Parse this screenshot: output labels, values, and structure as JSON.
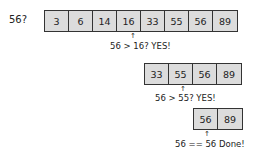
{
  "target_label": "56?",
  "steps": [
    {
      "cells": [
        "3",
        "6",
        "14",
        "16",
        "33",
        "55",
        "56",
        "89"
      ],
      "note": "56 > 16? YES!"
    },
    {
      "cells": [
        "33",
        "55",
        "56",
        "89"
      ],
      "note": "56 > 55? YES!"
    },
    {
      "cells": [
        "56",
        "89"
      ],
      "note": "56 == 56 Done!"
    }
  ],
  "colors": {
    "cell_fill": "#dcdcdc",
    "border": "#333333"
  }
}
